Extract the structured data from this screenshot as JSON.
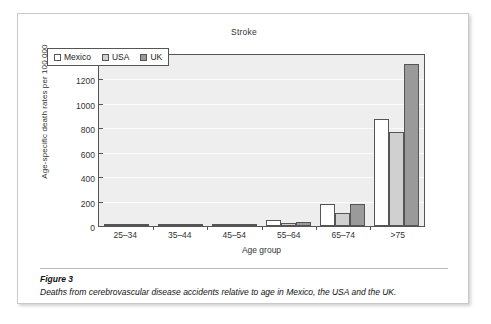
{
  "figure": {
    "caption_title": "Figure 3",
    "caption_text": "Deaths from cerebrovascular disease accidents relative to age in Mexico, the USA and the UK."
  },
  "chart_data": {
    "type": "bar",
    "title": "Stroke",
    "xlabel": "Age group",
    "ylabel": "Age-specific death rates per 100 000",
    "categories": [
      "25–34",
      "35–44",
      "45–54",
      "55–64",
      "65–74",
      ">75"
    ],
    "series": [
      {
        "name": "Mexico",
        "color": "#ffffff",
        "values": [
          1,
          5,
          18,
          50,
          178,
          874
        ]
      },
      {
        "name": "USA",
        "color": "#d0d0d0",
        "values": [
          1,
          3,
          6,
          22,
          110,
          768
        ]
      },
      {
        "name": "UK",
        "color": "#9a9a9a",
        "values": [
          1,
          3,
          7,
          35,
          182,
          1329
        ]
      }
    ],
    "ylim": [
      0,
      1400
    ],
    "yticks": [
      1400,
      1200,
      1000,
      800,
      600,
      400,
      200,
      0
    ],
    "grid": true,
    "legend_position": "upper-left"
  }
}
